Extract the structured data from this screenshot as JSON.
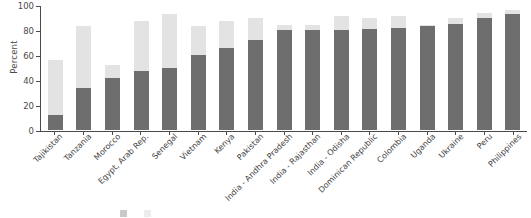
{
  "chart_data": {
    "type": "bar",
    "title": "",
    "xlabel": "",
    "ylabel": "Percent",
    "ylim": [
      0,
      100
    ],
    "yticks": [
      0,
      20,
      40,
      60,
      80,
      100
    ],
    "grid": false,
    "stacked": true,
    "legend_position": "bottom",
    "categories": [
      "Tajikistan",
      "Tanzania",
      "Morocco",
      "Egypt, Arab Rep.",
      "Senegal",
      "Vietnam",
      "Kenya",
      "Pakistan",
      "India - Andhra Pradesh",
      "India - Rajasthan",
      "India - Odisha",
      "Dominican Republic",
      "Colombia",
      "Uganda",
      "Ukraine",
      "Peru",
      "Philippines"
    ],
    "series": [
      {
        "name": "dark-series",
        "color": "#6e6e6e",
        "values": [
          12,
          34,
          42,
          47,
          50,
          60,
          66,
          72,
          80,
          80,
          80,
          81,
          82,
          83,
          85,
          90,
          93
        ]
      },
      {
        "name": "light-series",
        "color": "#e3e3e3",
        "values": [
          56,
          83,
          52,
          87,
          93,
          83,
          87,
          90,
          84,
          84,
          91,
          90,
          91,
          84,
          90,
          94,
          96
        ]
      }
    ]
  },
  "axis": {
    "ylabel": "Percent",
    "tick_labels": [
      "100",
      "80",
      "60",
      "40",
      "20",
      "0"
    ]
  },
  "legend": {
    "items": [
      {
        "label": "",
        "swatch": "dark"
      },
      {
        "label": "",
        "swatch": "light"
      }
    ]
  }
}
